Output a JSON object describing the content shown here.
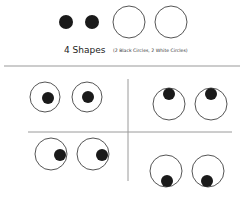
{
  "header": {
    "title": "4 Shapes",
    "subtitle": "(2 Black Circles, 2 White Circles)"
  },
  "colors": {
    "background": "#ffffff",
    "ink": "#1a1a1a",
    "outline": "#555555",
    "divider": "#9a9a9a"
  },
  "legend_shapes": [
    {
      "kind": "black-circle",
      "cx": 66,
      "cy": 22,
      "r": 7
    },
    {
      "kind": "black-circle",
      "cx": 92,
      "cy": 22,
      "r": 7
    },
    {
      "kind": "white-circle",
      "cx": 129,
      "cy": 22,
      "r": 16
    },
    {
      "kind": "white-circle",
      "cx": 171,
      "cy": 22,
      "r": 16
    }
  ],
  "panels": [
    {
      "name": "eyes-center",
      "gaze": "center",
      "eyes": [
        {
          "cx": 45,
          "cy": 97,
          "r": 15,
          "px": 48,
          "py": 98
        },
        {
          "cx": 87,
          "cy": 97,
          "r": 15,
          "px": 88,
          "py": 97
        }
      ]
    },
    {
      "name": "eyes-up",
      "gaze": "up",
      "eyes": [
        {
          "cx": 169,
          "cy": 104,
          "r": 16,
          "px": 169,
          "py": 94
        },
        {
          "cx": 211,
          "cy": 104,
          "r": 16,
          "px": 211,
          "py": 94
        }
      ]
    },
    {
      "name": "eyes-right",
      "gaze": "right",
      "eyes": [
        {
          "cx": 51,
          "cy": 154,
          "r": 16,
          "px": 60,
          "py": 155
        },
        {
          "cx": 93,
          "cy": 154,
          "r": 16,
          "px": 102,
          "py": 155
        }
      ]
    },
    {
      "name": "eyes-down",
      "gaze": "down",
      "eyes": [
        {
          "cx": 166,
          "cy": 171,
          "r": 16,
          "px": 167,
          "py": 181
        },
        {
          "cx": 208,
          "cy": 171,
          "r": 16,
          "px": 207,
          "py": 181
        }
      ]
    }
  ],
  "dividers": {
    "top": {
      "x1": 4,
      "y1": 66,
      "x2": 240,
      "y2": 66
    },
    "vertical": {
      "x1": 128,
      "y1": 79,
      "x2": 128,
      "y2": 181
    },
    "middle": {
      "x1": 28,
      "y1": 132,
      "x2": 232,
      "y2": 132
    }
  },
  "pupil_radius": 6
}
